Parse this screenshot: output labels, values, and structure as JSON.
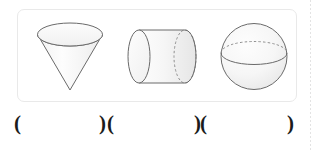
{
  "page": {
    "background_color": "#ffffff",
    "ink_color": "#1b1b1b"
  },
  "page_edge_rule": {
    "name": "dotted-page-edge",
    "color": "#d9d9d9"
  },
  "figure_panel": {
    "border_color": "#e9e9e9",
    "background_color": "#ffffff",
    "figures": [
      {
        "id": "cone",
        "label": "cone",
        "orientation": "inverted",
        "description": "Inverted cone with elliptical top face and apex pointing down",
        "outline_color": "#666666",
        "fill_color": "#fbfbfb",
        "hidden_edge_style": "none"
      },
      {
        "id": "cylinder",
        "label": "cylinder",
        "orientation": "horizontal",
        "description": "Horizontal cylinder, solid near-end ellipse on the left, dashed far-end ellipse on the right",
        "outline_color": "#666666",
        "fill_color": "#f7f7f7",
        "hidden_edge_style": "dashed"
      },
      {
        "id": "sphere",
        "label": "sphere",
        "orientation": "upright",
        "description": "Sphere with equator ellipse: front arc solid, back arc dashed",
        "outline_color": "#666666",
        "fill_color": "#f7f7f7",
        "hidden_edge_style": "dashed"
      }
    ]
  },
  "answers": {
    "name": "answer-parentheses-row",
    "open_paren": "(",
    "close_paren": ")",
    "blanks": [
      {
        "for_figure": "cone",
        "value": ""
      },
      {
        "for_figure": "cylinder",
        "value": ""
      },
      {
        "for_figure": "sphere",
        "value": ""
      }
    ]
  }
}
